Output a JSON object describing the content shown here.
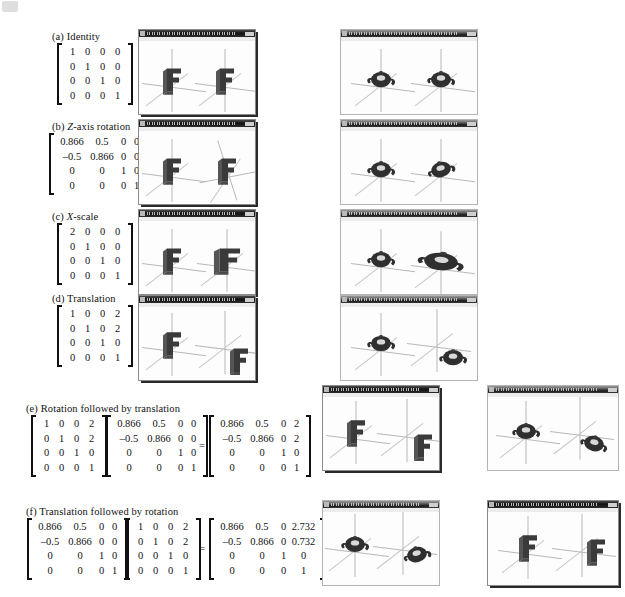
{
  "figure": {
    "rows": [
      {
        "id": "a",
        "label": "(a) Identity",
        "label_prefix": "(a) ",
        "label_text": "Identity",
        "label_italic": "",
        "matrices": [
          {
            "rows": [
              [
                "1",
                "0",
                "0",
                "0"
              ],
              [
                "0",
                "1",
                "0",
                "0"
              ],
              [
                "0",
                "0",
                "1",
                "0"
              ],
              [
                "0",
                "0",
                "0",
                "1"
              ]
            ]
          }
        ]
      },
      {
        "id": "b",
        "label": "(b) Z-axis rotation",
        "label_prefix": "(b) ",
        "label_italic": "Z",
        "label_text": "-axis rotation",
        "matrices": [
          {
            "rows": [
              [
                "0.866",
                "0.5",
                "0",
                "0"
              ],
              [
                "–0.5",
                "0.866",
                "0",
                "0"
              ],
              [
                "0",
                "0",
                "1",
                "0"
              ],
              [
                "0",
                "0",
                "0",
                "1"
              ]
            ]
          }
        ]
      },
      {
        "id": "c",
        "label": "(c) X-scale",
        "label_prefix": "(c) ",
        "label_italic": "X",
        "label_text": "-scale",
        "matrices": [
          {
            "rows": [
              [
                "2",
                "0",
                "0",
                "0"
              ],
              [
                "0",
                "1",
                "0",
                "0"
              ],
              [
                "0",
                "0",
                "1",
                "0"
              ],
              [
                "0",
                "0",
                "0",
                "1"
              ]
            ]
          }
        ]
      },
      {
        "id": "d",
        "label": "(d) Translation",
        "label_prefix": "(d) ",
        "label_text": "Translation",
        "label_italic": "",
        "matrices": [
          {
            "rows": [
              [
                "1",
                "0",
                "0",
                "2"
              ],
              [
                "0",
                "1",
                "0",
                "2"
              ],
              [
                "0",
                "0",
                "1",
                "0"
              ],
              [
                "0",
                "0",
                "0",
                "1"
              ]
            ]
          }
        ]
      },
      {
        "id": "e",
        "label": "(e) Rotation followed by translation",
        "label_prefix": "(e) ",
        "label_text": "Rotation followed by translation",
        "label_italic": "",
        "equals": "=",
        "matrices": [
          {
            "rows": [
              [
                "1",
                "0",
                "0",
                "2"
              ],
              [
                "0",
                "1",
                "0",
                "2"
              ],
              [
                "0",
                "0",
                "1",
                "0"
              ],
              [
                "0",
                "0",
                "0",
                "1"
              ]
            ]
          },
          {
            "rows": [
              [
                "0.866",
                "0.5",
                "0",
                "0"
              ],
              [
                "–0.5",
                "0.866",
                "0",
                "0"
              ],
              [
                "0",
                "0",
                "1",
                "0"
              ],
              [
                "0",
                "0",
                "0",
                "1"
              ]
            ]
          },
          {
            "rows": [
              [
                "0.866",
                "0.5",
                "0",
                "2"
              ],
              [
                "–0.5",
                "0.866",
                "0",
                "2"
              ],
              [
                "0",
                "0",
                "1",
                "0"
              ],
              [
                "0",
                "0",
                "0",
                "1"
              ]
            ]
          }
        ]
      },
      {
        "id": "f",
        "label": "(f) Translation followed by rotation",
        "label_prefix": "(f) ",
        "label_text": "Translation followed by rotation",
        "label_italic": "",
        "equals": "=",
        "matrices": [
          {
            "rows": [
              [
                "0.866",
                "0.5",
                "0",
                "0"
              ],
              [
                "–0.5",
                "0.866",
                "0",
                "0"
              ],
              [
                "0",
                "0",
                "1",
                "0"
              ],
              [
                "0",
                "0",
                "0",
                "1"
              ]
            ]
          },
          {
            "rows": [
              [
                "1",
                "0",
                "0",
                "2"
              ],
              [
                "0",
                "1",
                "0",
                "2"
              ],
              [
                "0",
                "0",
                "1",
                "0"
              ],
              [
                "0",
                "0",
                "0",
                "1"
              ]
            ]
          },
          {
            "rows": [
              [
                "0.866",
                "0.5",
                "0",
                "2.732"
              ],
              [
                "–0.5",
                "0.866",
                "0",
                "0.732"
              ],
              [
                "0",
                "0",
                "1",
                "0"
              ],
              [
                "0",
                "0",
                "0",
                "1"
              ]
            ]
          }
        ]
      }
    ],
    "colors": {
      "ink": "#111111",
      "window_border": "#8a8a8a",
      "titlebar_dark": "#121212",
      "canvas_bg": "#fdfdfd",
      "axis_line": "#b5b5b5",
      "object_fill": "#3a3a3a"
    },
    "windows": [
      {
        "id": "a-left",
        "object": "letter-f",
        "row": "a"
      },
      {
        "id": "a-right",
        "object": "teapot",
        "row": "a"
      },
      {
        "id": "b-left",
        "object": "letter-f",
        "row": "b"
      },
      {
        "id": "b-right",
        "object": "teapot",
        "row": "b"
      },
      {
        "id": "c-left",
        "object": "letter-f",
        "row": "c"
      },
      {
        "id": "c-right",
        "object": "teapot",
        "row": "c"
      },
      {
        "id": "d-left",
        "object": "letter-f",
        "row": "d"
      },
      {
        "id": "d-right",
        "object": "teapot",
        "row": "d"
      },
      {
        "id": "e-left",
        "object": "letter-f",
        "row": "e"
      },
      {
        "id": "e-right",
        "object": "teapot",
        "row": "e"
      },
      {
        "id": "f-left",
        "object": "teapot",
        "row": "f"
      },
      {
        "id": "f-right",
        "object": "letter-f",
        "row": "f"
      }
    ]
  }
}
